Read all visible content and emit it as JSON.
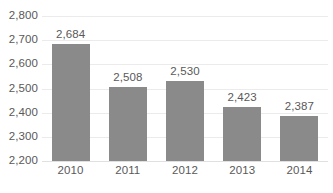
{
  "chart_data": {
    "type": "bar",
    "title": "",
    "subtitle": "",
    "xlabel": "",
    "ylabel": "",
    "categories": [
      "2010",
      "2011",
      "2012",
      "2013",
      "2014"
    ],
    "values": [
      2684,
      2508,
      2530,
      2423,
      2387
    ],
    "value_labels": [
      "2,684",
      "2,508",
      "2,530",
      "2,423",
      "2,387"
    ],
    "ylim": [
      2200,
      2800
    ],
    "ytick_step": 100,
    "ytick_labels": [
      "2,800",
      "2,700",
      "2,600",
      "2,500",
      "2,400",
      "2,300",
      "2,200"
    ],
    "ytick_values": [
      2800,
      2700,
      2600,
      2500,
      2400,
      2300,
      2200
    ],
    "grid": true,
    "legend": false,
    "legend_position": "none",
    "colors": {
      "bar": "#8a8a8a",
      "text": "#595959",
      "gridline": "#ebebeb",
      "baseline": "#e0e0e0",
      "background": "#ffffff"
    }
  }
}
